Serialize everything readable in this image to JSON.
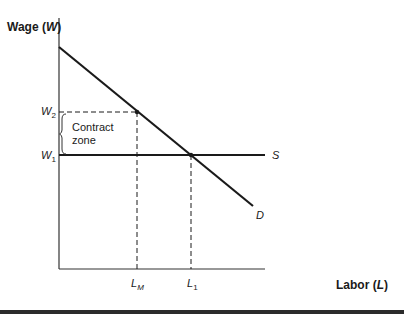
{
  "diagram": {
    "type": "labor-market-union-contract-zone",
    "y_axis_label": "Wage",
    "y_axis_symbol": "W",
    "x_axis_label": "Labor",
    "x_axis_symbol": "L",
    "wage_levels": [
      {
        "name": "W",
        "sub": "2",
        "meaning": "upper contract wage"
      },
      {
        "name": "W",
        "sub": "1",
        "meaning": "supply wage"
      }
    ],
    "labor_levels": [
      {
        "name": "L",
        "sub": "M"
      },
      {
        "name": "L",
        "sub": "1"
      }
    ],
    "curves": {
      "supply": {
        "label": "S",
        "shape": "horizontal at W1"
      },
      "demand": {
        "label": "D",
        "shape": "downward sloping"
      }
    },
    "annotation": {
      "line1": "Contract",
      "line2": "zone"
    },
    "colors": {
      "line": "#1a1a1a",
      "axis": "#333333",
      "bottom_bar": "#2b2b2b"
    }
  }
}
